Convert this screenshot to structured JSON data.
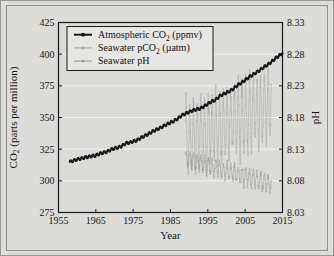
{
  "chart_data": {
    "type": "line",
    "title": "",
    "xlabel": "Year",
    "ylabel": "CO2 (parts per million)",
    "ylabel_left_main": "CO",
    "ylabel_left_sub": "2",
    "ylabel_left_rest": " (parts per million)",
    "y2label": "pH",
    "xlim": [
      1955,
      2015
    ],
    "ylim": [
      275,
      425
    ],
    "y2lim": [
      8.03,
      8.33
    ],
    "grid": "horizontal-white",
    "legend_position": "upper-left-inside",
    "xticks": [
      1955,
      1965,
      1975,
      1985,
      1995,
      2005,
      2015
    ],
    "yticks": [
      275,
      300,
      325,
      350,
      375,
      400,
      425
    ],
    "y2ticks": [
      "8.03",
      "8.08",
      "8.13",
      "8.18",
      "8.23",
      "8.28",
      "8.33"
    ],
    "legend": [
      {
        "name": "Atmospheric CO2 (ppmv)",
        "pre": "Atmospheric CO",
        "sub": "2",
        "post": " (ppmv)",
        "color": "#15151a",
        "marker": "filled-circle",
        "axis": "left"
      },
      {
        "name": "Seawater pCO2 (µatm)",
        "pre": "Seawater pCO",
        "sub": "2",
        "post": " (µatm)",
        "color": "#a8a8a4",
        "marker": "filled-circle",
        "axis": "left"
      },
      {
        "name": "Seawater pH",
        "pre": "Seawater pH",
        "sub": "",
        "post": "",
        "color": "#9e9e9a",
        "marker": "filled-circle",
        "axis": "right"
      }
    ],
    "series": [
      {
        "name": "Atmospheric CO2 (ppmv)",
        "axis": "left",
        "units": "ppmv",
        "x": [
          1958,
          1959,
          1960,
          1961,
          1962,
          1963,
          1964,
          1965,
          1966,
          1967,
          1968,
          1969,
          1970,
          1971,
          1972,
          1973,
          1974,
          1975,
          1976,
          1977,
          1978,
          1979,
          1980,
          1981,
          1982,
          1983,
          1984,
          1985,
          1986,
          1987,
          1988,
          1989,
          1990,
          1991,
          1992,
          1993,
          1994,
          1995,
          1996,
          1997,
          1998,
          1999,
          2000,
          2001,
          2002,
          2003,
          2004,
          2005,
          2006,
          2007,
          2008,
          2009,
          2010,
          2011,
          2012,
          2013,
          2014,
          2015
        ],
        "y": [
          315.0,
          315.9,
          316.9,
          317.6,
          318.4,
          319.0,
          319.6,
          320.0,
          321.4,
          322.2,
          323.0,
          324.6,
          325.7,
          326.3,
          327.5,
          329.7,
          330.2,
          331.1,
          332.0,
          333.8,
          335.4,
          336.8,
          338.7,
          340.1,
          341.4,
          343.0,
          344.6,
          346.0,
          347.4,
          349.2,
          351.6,
          353.1,
          354.4,
          355.6,
          356.4,
          357.1,
          358.8,
          360.8,
          362.6,
          363.7,
          366.6,
          368.3,
          369.5,
          371.0,
          373.1,
          375.6,
          377.4,
          379.6,
          381.8,
          383.7,
          385.6,
          387.4,
          389.8,
          391.6,
          393.8,
          396.5,
          398.6,
          400.8
        ]
      },
      {
        "name": "Seawater pCO2 (µatm)",
        "axis": "left",
        "units": "µatm",
        "note": "high-frequency monthly record, large seasonal amplitude, rising trend",
        "start_year": 1989,
        "end_year": 2012,
        "trend_start": 330,
        "trend_end": 360,
        "amplitude": 26
      },
      {
        "name": "Seawater pH",
        "axis": "right",
        "units": "pH",
        "note": "high-frequency monthly record, declining trend",
        "start_year": 1989,
        "end_year": 2012,
        "trend_start": 8.115,
        "trend_end": 8.075,
        "amplitude": 0.013
      }
    ]
  }
}
